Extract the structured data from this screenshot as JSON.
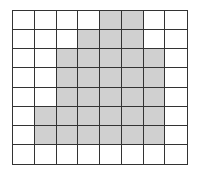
{
  "grid": {
    "rows": 8,
    "cols": 8,
    "fill_color": "#d0d0d0",
    "line_color": "#333333",
    "shaded": [
      [
        0,
        0,
        0,
        0,
        1,
        1,
        0,
        0
      ],
      [
        0,
        0,
        0,
        1,
        1,
        1,
        0,
        0
      ],
      [
        0,
        0,
        1,
        1,
        1,
        1,
        1,
        0
      ],
      [
        0,
        0,
        1,
        1,
        1,
        1,
        1,
        0
      ],
      [
        0,
        0,
        1,
        1,
        1,
        1,
        1,
        0
      ],
      [
        0,
        1,
        1,
        1,
        1,
        1,
        1,
        0
      ],
      [
        0,
        1,
        1,
        1,
        1,
        1,
        1,
        0
      ],
      [
        0,
        0,
        0,
        0,
        0,
        0,
        0,
        0
      ]
    ]
  }
}
